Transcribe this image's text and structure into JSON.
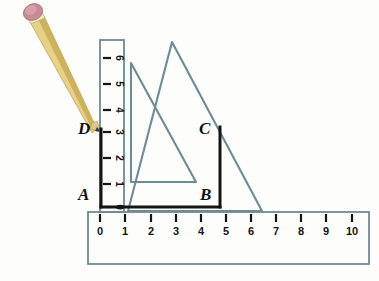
{
  "figure": {
    "background_color": "#fdfdfb",
    "instrument_color": "#6f8b93",
    "instrument_fill": "#ffffff",
    "drawn_line_color": "#141414",
    "pencil_body_color": "#e8d27a",
    "pencil_shade_color": "#c8ae55",
    "pencil_eraser_color": "#c48a96",
    "pencil_ferrule_color": "#f0e6c0",
    "pencil_tip_color": "#d8c27f"
  },
  "point_labels": [
    {
      "text": "A",
      "x": 78,
      "y": 186
    },
    {
      "text": "B",
      "x": 200,
      "y": 186
    },
    {
      "text": "C",
      "x": 199,
      "y": 120
    },
    {
      "text": "D",
      "x": 78,
      "y": 120
    }
  ],
  "horizontal_ruler": {
    "name": "horizontal-ruler",
    "x": 88,
    "y": 212,
    "width": 281,
    "height": 52,
    "tick_numbers": [
      "0",
      "1",
      "2",
      "3",
      "4",
      "5",
      "6",
      "7",
      "8",
      "9",
      "10"
    ],
    "tick_positions_x": [
      100,
      125,
      151,
      176,
      201,
      226,
      251,
      276,
      301,
      326,
      352
    ],
    "tick_top": 214,
    "tick_length": 8,
    "number_y": 226
  },
  "vertical_ruler": {
    "name": "vertical-ruler",
    "x": 100,
    "y": 40,
    "width": 24,
    "height": 172,
    "tick_numbers": [
      "6",
      "5",
      "4",
      "3",
      "2",
      "1",
      "0"
    ],
    "tick_positions_y": [
      58,
      84,
      110,
      132,
      158,
      184,
      207
    ],
    "tick_left": 103,
    "tick_length": 8,
    "number_x": 116
  },
  "small_set_square": {
    "name": "small-set-square",
    "points": "131,63 131,182 196,182"
  },
  "large_set_square": {
    "name": "large-set-square",
    "points": "172,42 262,211 128,211"
  },
  "drawn_rectangle": {
    "name": "drawn-rectangle-abcd",
    "segments": [
      {
        "name": "segment-ab",
        "x1": 101,
        "y1": 207,
        "x2": 220,
        "y2": 207
      },
      {
        "name": "segment-ad",
        "x1": 101,
        "y1": 207,
        "x2": 101,
        "y2": 129
      },
      {
        "name": "segment-bc",
        "x1": 220,
        "y1": 207,
        "x2": 220,
        "y2": 127
      }
    ]
  },
  "pencil": {
    "name": "pencil",
    "eraser_cx": 38,
    "eraser_cy": 14,
    "tip_x": 99,
    "tip_y": 131
  }
}
